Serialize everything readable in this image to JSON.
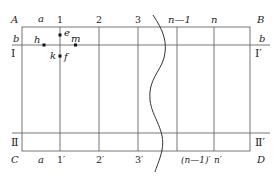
{
  "diagram": {
    "type": "grid-partition-schematic",
    "corners": {
      "top_left": "A",
      "top_right": "B",
      "bottom_left": "C",
      "bottom_right": "D"
    },
    "top_labels": {
      "gap": "a",
      "lines": [
        "1",
        "2",
        "3",
        "n—1",
        "n"
      ]
    },
    "bottom_labels": {
      "gap": "a",
      "lines": [
        "1′",
        "2′",
        "3′",
        "(n—1)′",
        "n′"
      ]
    },
    "horizontal_lines": {
      "upper": {
        "left_label": "b",
        "right_label": "b",
        "left_region": "Ⅰ",
        "right_region": "Ⅰ′"
      },
      "lower": {
        "left_region": "Ⅱ",
        "right_region": "Ⅱ′"
      }
    },
    "points": [
      {
        "name": "e",
        "desc": "on line 1, above line b"
      },
      {
        "name": "h",
        "desc": "on line b, left of line 1"
      },
      {
        "name": "m",
        "desc": "on line b, right of line 1"
      },
      {
        "name": "k",
        "desc": "label left of line 1, below line b"
      },
      {
        "name": "f",
        "desc": "on line 1, below line b"
      }
    ],
    "break_mark": "wavy-line"
  }
}
